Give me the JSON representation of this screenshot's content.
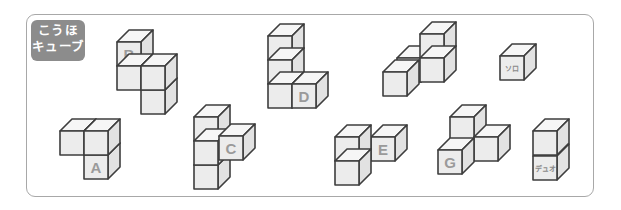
{
  "badge": {
    "line1": "こうほ",
    "line2": "キューブ"
  },
  "colors": {
    "stroke": "#3e3e3e",
    "front": "#ececec",
    "top": "#f6f6f6",
    "side": "#e2e2e2",
    "label": "#9a9a9a",
    "badge_bg": "#8c8c8c",
    "frame": "#a8a8a8"
  },
  "cube": {
    "size": 24,
    "dx": 12,
    "dy": -12
  },
  "shapes": [
    {
      "name": "B",
      "label": "B",
      "label_cube": 0,
      "cubes": [
        [
          117,
          42
        ],
        [
          117,
          66
        ],
        [
          141,
          90
        ],
        [
          141,
          66
        ]
      ]
    },
    {
      "name": "A",
      "label": "A",
      "label_cube": 0,
      "cubes": [
        [
          84,
          155
        ],
        [
          60,
          131
        ],
        [
          84,
          131
        ]
      ]
    },
    {
      "name": "D",
      "label": "D",
      "label_cube": 3,
      "cubes": [
        [
          268,
          36
        ],
        [
          268,
          60
        ],
        [
          268,
          84
        ],
        [
          292,
          84
        ]
      ]
    },
    {
      "name": "C",
      "label": "C",
      "label_cube": 3,
      "cubes": [
        [
          194,
          165
        ],
        [
          194,
          117
        ],
        [
          194,
          141
        ],
        [
          219,
          136
        ]
      ]
    },
    {
      "name": "F",
      "label": "F",
      "label_cube": 0,
      "cubes": [
        [
          397,
          58
        ],
        [
          420,
          34
        ],
        [
          420,
          58
        ],
        [
          383,
          72
        ]
      ]
    },
    {
      "name": "E",
      "label": "E",
      "label_cube": 0,
      "cubes": [
        [
          371,
          137
        ],
        [
          335,
          137
        ],
        [
          335,
          161
        ]
      ]
    },
    {
      "name": "G",
      "label": "G",
      "label_cube": 2,
      "cubes": [
        [
          450,
          117
        ],
        [
          474,
          137
        ],
        [
          438,
          150
        ]
      ]
    },
    {
      "name": "solo",
      "label": "ソロ",
      "label_cube": 0,
      "small": true,
      "cubes": [
        [
          500,
          56
        ]
      ]
    },
    {
      "name": "duo",
      "label": "デュオ",
      "label_cube": 0,
      "small": true,
      "cubes": [
        [
          533,
          156
        ],
        [
          533,
          131
        ]
      ]
    }
  ]
}
